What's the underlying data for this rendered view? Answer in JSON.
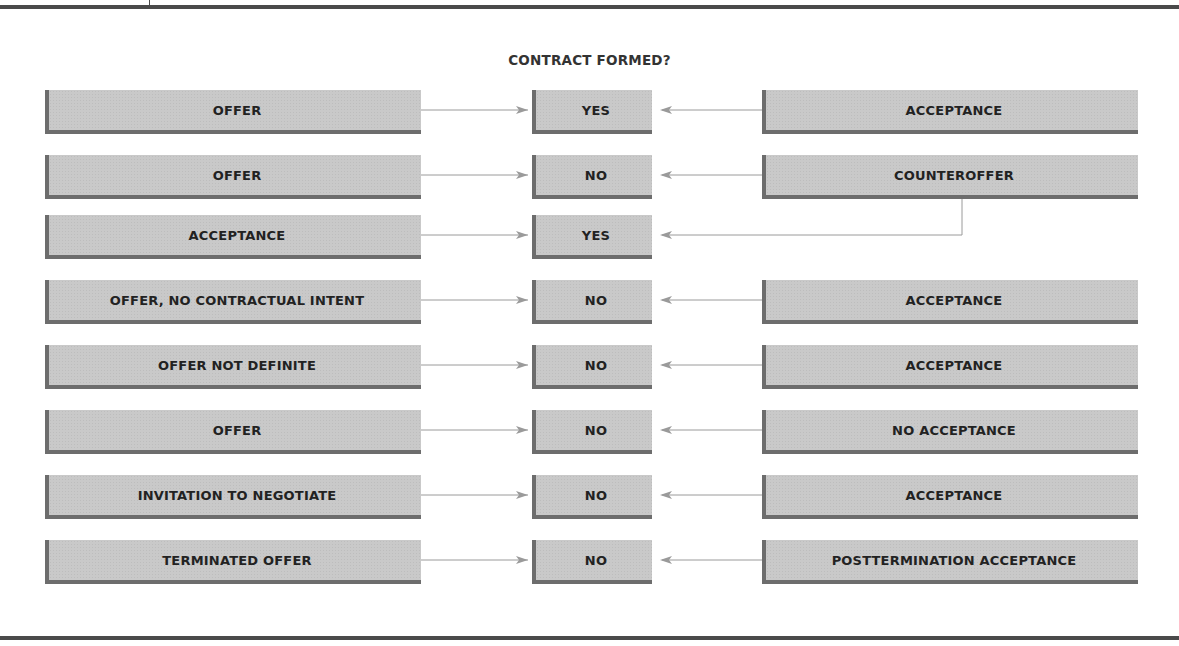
{
  "title": "CONTRACT FORMED?",
  "rows": [
    {
      "left": "OFFER",
      "result": "YES",
      "right": "ACCEPTANCE"
    },
    {
      "left": "OFFER",
      "result": "NO",
      "right": "COUNTEROFFER"
    },
    {
      "left": "ACCEPTANCE",
      "result": "YES",
      "right": null
    },
    {
      "left": "OFFER, NO CONTRACTUAL INTENT",
      "result": "NO",
      "right": "ACCEPTANCE"
    },
    {
      "left": "OFFER NOT DEFINITE",
      "result": "NO",
      "right": "ACCEPTANCE"
    },
    {
      "left": "OFFER",
      "result": "NO",
      "right": "NO ACCEPTANCE"
    },
    {
      "left": "INVITATION TO NEGOTIATE",
      "result": "NO",
      "right": "ACCEPTANCE"
    },
    {
      "left": "TERMINATED OFFER",
      "result": "NO",
      "right": "POSTTERMINATION ACCEPTANCE"
    }
  ],
  "connectors": {
    "counteroffer_feeds_row": 2,
    "note": "Counteroffer connects down to the third row's YES result"
  }
}
